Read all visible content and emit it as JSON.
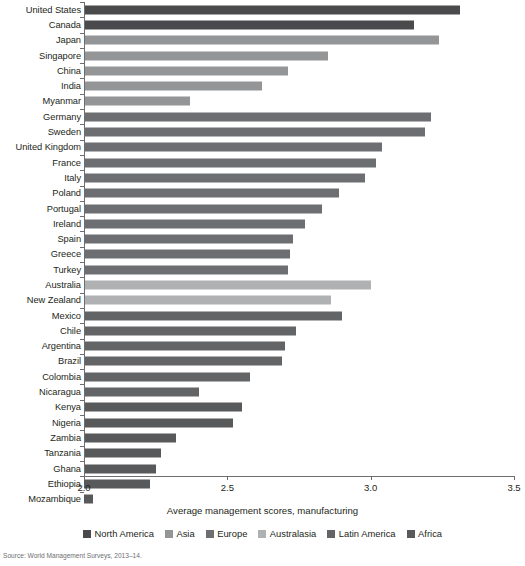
{
  "chart_data": {
    "type": "bar",
    "orientation": "horizontal",
    "title": "",
    "xlabel": "Average management scores, manufacturing",
    "ylabel": "",
    "xlim": [
      2.0,
      3.5
    ],
    "xticks": [
      2.0,
      2.5,
      3.0,
      3.5
    ],
    "xtick_labels": [
      "2.0",
      "2.5",
      "3.0",
      "3.5"
    ],
    "grid": false,
    "legend_position": "bottom",
    "categories": [
      "United States",
      "Canada",
      "Japan",
      "Singapore",
      "China",
      "India",
      "Myanmar",
      "Germany",
      "Sweden",
      "United Kingdom",
      "France",
      "Italy",
      "Poland",
      "Portugal",
      "Ireland",
      "Spain",
      "Greece",
      "Turkey",
      "Australia",
      "New Zealand",
      "Mexico",
      "Chile",
      "Argentina",
      "Brazil",
      "Colombia",
      "Nicaragua",
      "Kenya",
      "Nigeria",
      "Zambia",
      "Tanzania",
      "Ghana",
      "Ethiopia",
      "Mozambique"
    ],
    "values": [
      3.31,
      3.15,
      3.24,
      2.85,
      2.71,
      2.62,
      2.37,
      3.21,
      3.19,
      3.04,
      3.02,
      2.98,
      2.89,
      2.83,
      2.77,
      2.73,
      2.72,
      2.71,
      3.0,
      2.86,
      2.9,
      2.74,
      2.7,
      2.69,
      2.58,
      2.4,
      2.55,
      2.52,
      2.32,
      2.27,
      2.25,
      2.23,
      2.03
    ],
    "groups": [
      "North America",
      "North America",
      "Asia",
      "Asia",
      "Asia",
      "Asia",
      "Asia",
      "Europe",
      "Europe",
      "Europe",
      "Europe",
      "Europe",
      "Europe",
      "Europe",
      "Europe",
      "Europe",
      "Europe",
      "Europe",
      "Australasia",
      "Australasia",
      "Latin America",
      "Latin America",
      "Latin America",
      "Latin America",
      "Latin America",
      "Latin America",
      "Africa",
      "Africa",
      "Africa",
      "Africa",
      "Africa",
      "Africa",
      "Africa"
    ],
    "legend": [
      {
        "label": "North America",
        "color": "#4a4a4c"
      },
      {
        "label": "Asia",
        "color": "#949597"
      },
      {
        "label": "Europe",
        "color": "#6d6e71"
      },
      {
        "label": "Australasia",
        "color": "#b0b1b3"
      },
      {
        "label": "Latin America",
        "color": "#636466"
      },
      {
        "label": "Africa",
        "color": "#58595b"
      }
    ],
    "group_colors": {
      "North America": "#4a4a4c",
      "Asia": "#949597",
      "Europe": "#6d6e71",
      "Australasia": "#b0b1b3",
      "Latin America": "#636466",
      "Africa": "#58595b"
    }
  },
  "source_note": "Source: World Management Surveys, 2013–14."
}
